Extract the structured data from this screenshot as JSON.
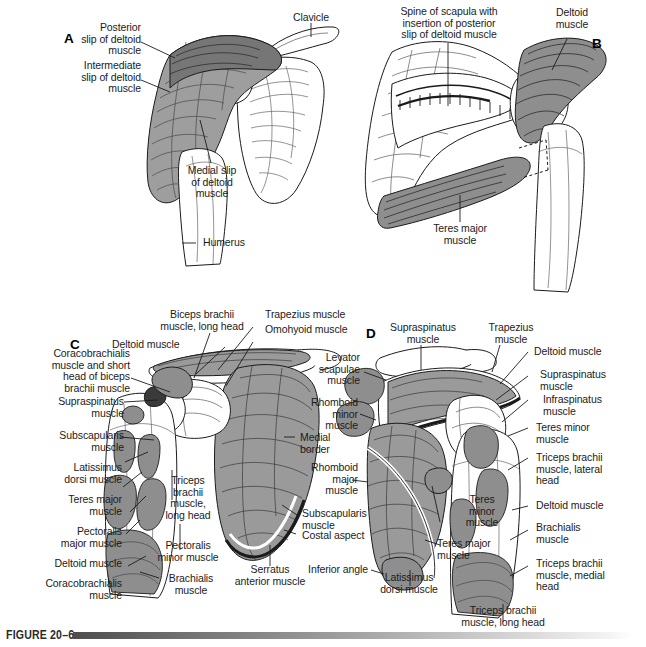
{
  "figure": {
    "caption_label": "FIGURE 20–6"
  },
  "panels": [
    {
      "id": "A",
      "marker": "A",
      "view": "anterior shoulder with deltoid slips",
      "labels": [
        "Posterior\nslip of deltoid\nmuscle",
        "Intermediate\nslip of deltoid\nmuscle",
        "Clavicle",
        "Medial slip\nof deltoid\nmuscle",
        "Humerus"
      ]
    },
    {
      "id": "B",
      "marker": "B",
      "view": "posterior scapula with deltoid and teres major",
      "labels": [
        "Spine of scapula with\ninsertion of posterior\nslip of deltoid muscle",
        "Deltoid\nmuscle",
        "Teres major\nmuscle"
      ]
    },
    {
      "id": "C",
      "marker": "C",
      "view": "anterior (costal) aspect of scapula and humerus, muscle attachments",
      "labels": [
        "Biceps brachii\nmuscle, long head",
        "Trapezius muscle",
        "Omohyoid muscle",
        "Deltoid muscle",
        "Coracobrachialis\nmuscle and short\nhead of biceps\nbrachii muscle",
        "Supraspinatus\nmuscle",
        "Subscapularis\nmuscle",
        "Latissimus\ndorsi muscle",
        "Teres major\nmuscle",
        "Pectoralis\nmajor muscle",
        "Deltoid muscle",
        "Coracobrachialis\nmuscle",
        "Triceps\nbrachii\nmuscle,\nlong head",
        "Pectoralis\nminor muscle",
        "Brachialis\nmuscle",
        "Serratus\nanterior muscle",
        "Medial\nborder",
        "Subscapularis\nmuscle",
        "Costal aspect"
      ]
    },
    {
      "id": "D",
      "marker": "D",
      "view": "posterior (dorsal) aspect of scapula and humerus, muscle attachments",
      "labels": [
        "Supraspinatus\nmuscle",
        "Trapezius\nmuscle",
        "Levator\nscapulae\nmuscle",
        "Rhomboid\nminor\nmuscle",
        "Rhomboid\nmajor\nmuscle",
        "Inferior angle",
        "Latissimus\ndorsi muscle",
        "Teres major\nmuscle",
        "Teres\nminor\nmuscle",
        "Deltoid muscle",
        "Supraspinatus\nmuscle",
        "Infraspinatus\nmuscle",
        "Teres minor\nmuscle",
        "Triceps brachii\nmuscle, lateral\nhead",
        "Deltoid muscle",
        "Brachialis\nmuscle",
        "Triceps brachii\nmuscle, medial\nhead",
        "Triceps brachii\nmuscle, long head"
      ]
    }
  ],
  "labels_positioned": {
    "a_posterior_slip": "Posterior\nslip of deltoid\nmuscle",
    "a_intermediate_slip": "Intermediate\nslip of deltoid\nmuscle",
    "a_clavicle": "Clavicle",
    "a_medial_slip": "Medial slip\nof deltoid\nmuscle",
    "a_humerus": "Humerus",
    "b_spine_scapula": "Spine of scapula with\ninsertion of posterior\nslip of deltoid muscle",
    "b_deltoid": "Deltoid\nmuscle",
    "b_teres_major": "Teres major\nmuscle",
    "c_biceps_long_head": "Biceps brachii\nmuscle, long head",
    "c_trapezius": "Trapezius muscle",
    "c_omohyoid": "Omohyoid muscle",
    "c_deltoid_top": "Deltoid muscle",
    "c_coracobrachialis_short_biceps": "Coracobrachialis\nmuscle and short\nhead of biceps\nbrachii muscle",
    "c_supraspinatus": "Supraspinatus\nmuscle",
    "c_subscapularis_left": "Subscapularis\nmuscle",
    "c_latissimus": "Latissimus\ndorsi muscle",
    "c_teres_major": "Teres major\nmuscle",
    "c_pectoralis_major": "Pectoralis\nmajor muscle",
    "c_deltoid_left": "Deltoid muscle",
    "c_coracobrachialis": "Coracobrachialis\nmuscle",
    "c_triceps_long_head": "Triceps\nbrachii\nmuscle,\nlong head",
    "c_pectoralis_minor": "Pectoralis\nminor muscle",
    "c_brachialis": "Brachialis\nmuscle",
    "c_serratus": "Serratus\nanterior muscle",
    "c_medial_border": "Medial\nborder",
    "c_subscapularis_right": "Subscapularis\nmuscle",
    "c_costal_aspect": "Costal aspect",
    "d_supraspinatus_top": "Supraspinatus\nmuscle",
    "d_trapezius": "Trapezius\nmuscle",
    "d_levator_scapulae": "Levator\nscapulae\nmuscle",
    "d_rhomboid_minor": "Rhomboid\nminor\nmuscle",
    "d_rhomboid_major": "Rhomboid\nmajor\nmuscle",
    "d_inferior_angle": "Inferior angle",
    "d_latissimus": "Latissimus\ndorsi muscle",
    "d_teres_major": "Teres major\nmuscle",
    "d_teres_minor_mid": "Teres\nminor\nmuscle",
    "d_deltoid_top": "Deltoid muscle",
    "d_supraspinatus_right": "Supraspinatus\nmuscle",
    "d_infraspinatus": "Infraspinatus\nmuscle",
    "d_teres_minor_right": "Teres minor\nmuscle",
    "d_triceps_lateral": "Triceps brachii\nmuscle, lateral\nhead",
    "d_deltoid_low": "Deltoid muscle",
    "d_brachialis": "Brachialis\nmuscle",
    "d_triceps_medial": "Triceps brachii\nmuscle, medial\nhead",
    "d_triceps_long": "Triceps brachii\nmuscle, long head"
  },
  "markers": {
    "a": "A",
    "b": "B",
    "c": "C",
    "d": "D"
  },
  "colors": {
    "background": "#ffffff",
    "ink": "#1b1b1b",
    "muscle_fill": "#9a9a9a",
    "muscle_fill_dark": "#6e6e6e",
    "bone_fill": "#ffffff",
    "caption_bar_start": "#4d4d4d",
    "caption_bar_end": "#ffffff"
  }
}
